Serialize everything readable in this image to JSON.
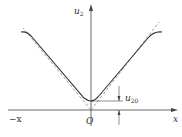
{
  "diagram": {
    "labels": {
      "y_axis": "u",
      "y_axis_sub": "2",
      "x_axis": "x",
      "neg_x_axis": "−x",
      "origin": "O",
      "marker": "u",
      "marker_sub": "20"
    },
    "colors": {
      "curve": "#333333",
      "axis": "#444444",
      "asymptote": "#777777",
      "background": "#ffffff"
    }
  }
}
